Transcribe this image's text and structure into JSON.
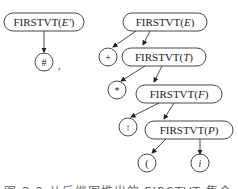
{
  "left_tree": {
    "root": {
      "prefix": "FIRSTVT(",
      "arg": "E'",
      "suffix": ")"
    },
    "leaf": "#",
    "separator": ","
  },
  "right_tree": {
    "nodes": [
      {
        "prefix": "FIRSTVT(",
        "arg": "E",
        "suffix": ")"
      },
      {
        "prefix": "FIRSTVT(",
        "arg": "T",
        "suffix": ")"
      },
      {
        "prefix": "FIRSTVT(",
        "arg": "F",
        "suffix": ")"
      },
      {
        "prefix": "FIRSTVT(",
        "arg": "P",
        "suffix": ")"
      }
    ],
    "leaves": [
      "+",
      "*",
      "↑",
      "(",
      "i"
    ]
  },
  "caption": "图 3.9  从后继图推出的 FIRSTVT 集合"
}
